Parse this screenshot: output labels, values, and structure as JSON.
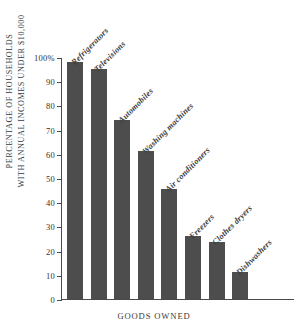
{
  "chart_data": {
    "type": "bar",
    "title": "",
    "subtitle": "",
    "xlabel": "GOODS OWNED",
    "ylabel": "PERCENTAGE OF HOUSEHOLDS WITH ANNUAL INCOMES UNDER $10,000",
    "ylabel_lines": [
      "PERCENTAGE OF HOUSEHOLDS",
      "WITH ANNUAL INCOMES UNDER $10,000"
    ],
    "categories": [
      "Refrigerators",
      "Televisions",
      "Automobiles",
      "Washing machines",
      "Air conditioners",
      "Freezers",
      "Clothes dryers",
      "Dishwashers"
    ],
    "values": [
      98,
      95,
      74,
      61,
      45.5,
      26,
      23.5,
      11
    ],
    "ylim": [
      0,
      100
    ],
    "ytick_values": [
      0,
      10,
      20,
      30,
      40,
      50,
      60,
      70,
      80,
      90,
      100
    ],
    "ytick_labels": [
      "0",
      "10",
      "20",
      "30",
      "40",
      "50",
      "60",
      "70",
      "80",
      "90",
      "100%"
    ],
    "grid": false,
    "legend": false,
    "legend_position": "none",
    "bar_color": "#4d4d4d",
    "axis_color": "#4a4a4a",
    "background_color": "#ffffff",
    "category_label_rotation": -45
  }
}
